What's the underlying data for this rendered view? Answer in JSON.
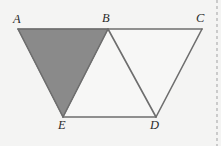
{
  "figure": {
    "type": "geometry-diagram",
    "canvas": {
      "width": 221,
      "height": 146
    },
    "background_color": "#f4f4f3",
    "stroke_color": "#6e6e6e",
    "stroke_width": 1.6,
    "shaded_fill_color": "#8a8a8a",
    "unshaded_fill_color": "#f7f7f6",
    "label_color": "#2b2b2b",
    "vertices": [
      {
        "id": "A",
        "label": "A",
        "x": 18,
        "y": 29,
        "label_x": 13,
        "label_y": 13
      },
      {
        "id": "B",
        "label": "B",
        "x": 108,
        "y": 29,
        "label_x": 102,
        "label_y": 12
      },
      {
        "id": "C",
        "label": "C",
        "x": 202,
        "y": 29,
        "label_x": 196,
        "label_y": 12
      },
      {
        "id": "E",
        "label": "E",
        "x": 63,
        "y": 117,
        "label_x": 58,
        "label_y": 119
      },
      {
        "id": "D",
        "label": "D",
        "x": 156,
        "y": 117,
        "label_x": 150,
        "label_y": 119
      }
    ],
    "polygons": [
      {
        "id": "triangle-ABE",
        "points": "18,29 108,29 63,117",
        "fill": "#8a8a8a",
        "shaded": true
      },
      {
        "id": "triangle-BED",
        "points": "108,29 156,117 63,117",
        "fill": "#f7f7f6",
        "shaded": false
      },
      {
        "id": "triangle-BCD",
        "points": "108,29 202,29 156,117",
        "fill": "#f7f7f6",
        "shaded": false
      }
    ],
    "segments": [
      {
        "id": "segment-AC",
        "x1": 18,
        "y1": 29,
        "x2": 202,
        "y2": 29
      },
      {
        "id": "segment-AE",
        "x1": 18,
        "y1": 29,
        "x2": 63,
        "y2": 117
      },
      {
        "id": "segment-BE",
        "x1": 108,
        "y1": 29,
        "x2": 63,
        "y2": 117
      },
      {
        "id": "segment-BD",
        "x1": 108,
        "y1": 29,
        "x2": 156,
        "y2": 117
      },
      {
        "id": "segment-CD",
        "x1": 202,
        "y1": 29,
        "x2": 156,
        "y2": 117
      },
      {
        "id": "segment-ED",
        "x1": 63,
        "y1": 117,
        "x2": 156,
        "y2": 117
      }
    ],
    "page_edge": {
      "id": "page-edge-dashed-rule",
      "x": 217,
      "y1": 0,
      "y2": 146,
      "color": "#b9b9b9",
      "dash": "3 3",
      "width": 1.4
    }
  }
}
